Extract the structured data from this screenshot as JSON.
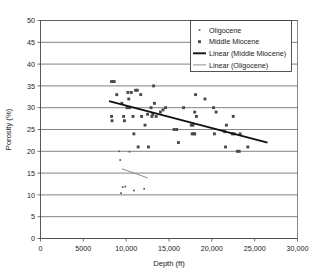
{
  "chart_data": {
    "type": "scatter",
    "title": "",
    "xlabel": "Depth (ft)",
    "ylabel": "Porosity (%)",
    "xlim": [
      0,
      30000
    ],
    "ylim": [
      0,
      50
    ],
    "xticks": [
      0,
      5000,
      10000,
      15000,
      20000,
      25000,
      30000
    ],
    "xtick_labels": [
      "0",
      "5000",
      "10,000",
      "15,000",
      "20,000",
      "25,000",
      "30,000"
    ],
    "yticks": [
      0,
      5,
      10,
      15,
      20,
      25,
      30,
      35,
      40,
      45,
      50
    ],
    "ytick_labels": [
      "0",
      "5",
      "10",
      "15",
      "20",
      "25",
      "30",
      "35",
      "40",
      "45",
      "50"
    ],
    "grid": "horizontal",
    "legend_position": "top-right",
    "legend": [
      {
        "label": "Oligocene",
        "kind": "marker",
        "marker": "small-dot",
        "color": "#5a5a5a"
      },
      {
        "label": "Middle Miocene",
        "kind": "marker",
        "marker": "square",
        "color": "#4a4a4a"
      },
      {
        "label": "Linear (Middle Miocene)",
        "kind": "line",
        "style": "thick",
        "color": "#111111"
      },
      {
        "label": "Linear (Oligocene)",
        "kind": "line",
        "style": "thin",
        "color": "#8e8e8e"
      }
    ],
    "series": [
      {
        "name": "Oligocene",
        "marker": "small-dot",
        "color": "#5a5a5a",
        "points": [
          [
            9200,
            20.0
          ],
          [
            9300,
            18.0
          ],
          [
            9400,
            10.4
          ],
          [
            9600,
            11.8
          ],
          [
            9900,
            11.9
          ],
          [
            10400,
            19.9
          ],
          [
            10900,
            11.0
          ],
          [
            12100,
            11.4
          ]
        ]
      },
      {
        "name": "Middle Miocene",
        "marker": "square",
        "color": "#4a4a4a",
        "points": [
          [
            8300,
            36.0
          ],
          [
            8600,
            36.0
          ],
          [
            8300,
            28.0
          ],
          [
            8350,
            27.0
          ],
          [
            8900,
            33.0
          ],
          [
            9500,
            31.0
          ],
          [
            9700,
            28.0
          ],
          [
            9800,
            27.0
          ],
          [
            10100,
            30.0
          ],
          [
            10200,
            33.5
          ],
          [
            10300,
            32.0
          ],
          [
            10400,
            30.0
          ],
          [
            10600,
            33.5
          ],
          [
            10800,
            28.0
          ],
          [
            10900,
            24.0
          ],
          [
            11100,
            34.0
          ],
          [
            11300,
            34.0
          ],
          [
            11400,
            21.0
          ],
          [
            11700,
            33.0
          ],
          [
            11800,
            28.0
          ],
          [
            12200,
            26.0
          ],
          [
            12500,
            28.5
          ],
          [
            12600,
            21.0
          ],
          [
            12900,
            30.0
          ],
          [
            13000,
            28.0
          ],
          [
            13100,
            28.5
          ],
          [
            13200,
            35.0
          ],
          [
            13300,
            31.0
          ],
          [
            13500,
            28.0
          ],
          [
            14000,
            29.0
          ],
          [
            14300,
            29.5
          ],
          [
            14600,
            30.0
          ],
          [
            15600,
            25.0
          ],
          [
            15900,
            25.0
          ],
          [
            16100,
            22.0
          ],
          [
            16700,
            30.0
          ],
          [
            17600,
            26.0
          ],
          [
            17700,
            24.0
          ],
          [
            17800,
            26.0
          ],
          [
            17900,
            24.0
          ],
          [
            18000,
            24.0
          ],
          [
            18000,
            29.0
          ],
          [
            18100,
            33.0
          ],
          [
            18200,
            28.0
          ],
          [
            19200,
            32.0
          ],
          [
            20200,
            30.0
          ],
          [
            20300,
            24.0
          ],
          [
            20500,
            29.0
          ],
          [
            21500,
            24.5
          ],
          [
            21600,
            21.0
          ],
          [
            21700,
            26.0
          ],
          [
            22400,
            24.0
          ],
          [
            22500,
            28.0
          ],
          [
            22600,
            24.0
          ],
          [
            23000,
            20.0
          ],
          [
            23200,
            20.0
          ],
          [
            23300,
            24.0
          ],
          [
            24200,
            21.0
          ]
        ]
      }
    ],
    "trendlines": [
      {
        "name": "Linear (Middle Miocene)",
        "x0": 8000,
        "y0": 31.5,
        "x1": 26500,
        "y1": 22.0,
        "color": "#111111",
        "width": "thick"
      },
      {
        "name": "Linear (Oligocene)",
        "x0": 9500,
        "y0": 16.0,
        "x1": 12500,
        "y1": 13.9,
        "color": "#8e8e8e",
        "width": "thin"
      }
    ]
  }
}
